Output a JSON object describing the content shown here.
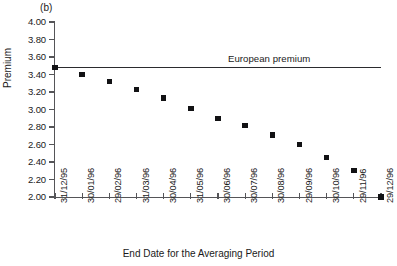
{
  "figure": {
    "panel_label": "(b)",
    "background_color": "#ffffff",
    "axis_color": "#555558",
    "marker_color": "#121214",
    "reference_line_color": "#2b2b2e"
  },
  "chart_data": {
    "type": "scatter",
    "title": "(b)",
    "xlabel": "End Date for the Averaging Period",
    "ylabel": "Premium",
    "categories": [
      "31/12/95",
      "30/01/96",
      "29/02/96",
      "31/03/96",
      "30/04/96",
      "31/05/96",
      "30/06/96",
      "30/07/96",
      "30/08/96",
      "29/09/96",
      "30/10/96",
      "29/11/96",
      "29/12/96"
    ],
    "values": [
      3.48,
      3.4,
      3.32,
      3.23,
      3.13,
      3.01,
      2.9,
      2.82,
      2.71,
      2.6,
      2.45,
      2.3,
      2.0
    ],
    "series": [
      {
        "name": "Asian premium",
        "values": [
          3.48,
          3.4,
          3.32,
          3.23,
          3.13,
          3.01,
          2.9,
          2.82,
          2.71,
          2.6,
          2.45,
          2.3,
          2.0
        ]
      }
    ],
    "ylim": [
      2.0,
      4.0
    ],
    "yticks": [
      2.0,
      2.2,
      2.4,
      2.6,
      2.8,
      3.0,
      3.2,
      3.4,
      3.6,
      3.8,
      4.0
    ],
    "ytick_labels": [
      "2.00",
      "2.20",
      "2.40",
      "2.60",
      "2.80",
      "3.00",
      "3.20",
      "3.40",
      "3.60",
      "3.80",
      "4.00"
    ],
    "grid": false,
    "legend": null,
    "annotations": [
      {
        "type": "hline",
        "label": "European premium",
        "value": 3.48
      }
    ]
  }
}
